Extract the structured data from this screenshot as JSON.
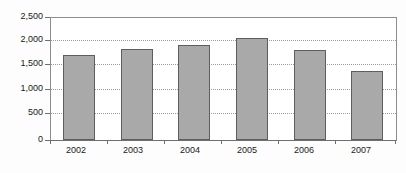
{
  "chart_data": {
    "type": "bar",
    "title": "",
    "subtitle": "",
    "xlabel": "",
    "ylabel": "",
    "categories": [
      "2002",
      "2003",
      "2004",
      "2005",
      "2006",
      "2007"
    ],
    "values": [
      1730,
      1850,
      1930,
      2075,
      1830,
      1400
    ],
    "ylim": [
      0,
      2500
    ],
    "yticks": [
      0,
      500,
      1000,
      1500,
      2000,
      2500
    ],
    "ytick_labels": [
      "0",
      "500",
      "1,000",
      "1,500",
      "2,000",
      "2,500"
    ],
    "grid": true,
    "grid_axis": "y",
    "grid_style": "dotted",
    "legend": false,
    "legend_position": "none",
    "bar_color": "#a9a9a9",
    "bar_border_color": "#5e5e5e",
    "axis_color": "#6f6f6f",
    "gridline_color": "#9b9b9b",
    "text_color": "#1a1a1a",
    "background_color": "#ffffff",
    "series": [
      {
        "name": "Series 1",
        "values": [
          1730,
          1850,
          1930,
          2075,
          1830,
          1400
        ]
      }
    ]
  },
  "figure": {
    "title_remnant": "—  —   —",
    "plot_background": "#ffffff"
  }
}
